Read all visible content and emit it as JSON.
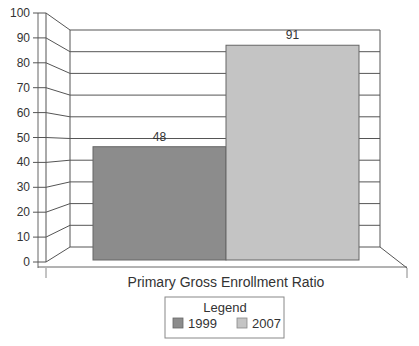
{
  "chart_data": {
    "type": "bar",
    "title": "",
    "xlabel": "Primary Gross Enrollment Ratio",
    "ylabel": "",
    "ylim": [
      0,
      100
    ],
    "yticks": [
      0,
      10,
      20,
      30,
      40,
      50,
      60,
      70,
      80,
      90,
      100
    ],
    "categories": [
      "Primary Gross Enrollment Ratio"
    ],
    "series": [
      {
        "name": "1999",
        "values": [
          48
        ],
        "color": "#8c8c8c"
      },
      {
        "name": "2007",
        "values": [
          91
        ],
        "color": "#c4c4c4"
      }
    ],
    "data_labels": [
      "48",
      "91"
    ],
    "grid": true,
    "style": "3d",
    "legend": {
      "title": "Legend",
      "placement": "bottom-center",
      "entries": [
        "1999",
        "2007"
      ]
    }
  }
}
